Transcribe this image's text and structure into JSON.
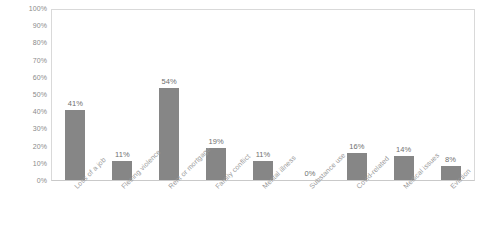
{
  "chart_data": {
    "type": "bar",
    "title": "",
    "subtitle": "",
    "xlabel": "",
    "ylabel": "",
    "ylim": [
      0,
      100
    ],
    "grid": false,
    "legend": false,
    "legend_position": "none",
    "value_suffix": "%",
    "bar_color": "#868686",
    "axis_label_color": "#9a9a9a",
    "tick_label_color": "#8a8a8a",
    "plot_border_color": "#d9d9d9",
    "categories": [
      "Loss of a job",
      "Fleeing violence",
      "Rent or mortgage",
      "Family conflict",
      "Mental illness",
      "Substance use",
      "Covid-related",
      "Medical issues",
      "Eviction"
    ],
    "values": [
      41,
      11,
      54,
      19,
      11,
      0,
      16,
      14,
      8
    ],
    "data_labels": [
      "41%",
      "11%",
      "54%",
      "19%",
      "11%",
      "0%",
      "16%",
      "14%",
      "8%"
    ],
    "y_ticks": [
      0,
      10,
      20,
      30,
      40,
      50,
      60,
      70,
      80,
      90,
      100
    ],
    "y_tick_labels": [
      "0%",
      "10%",
      "20%",
      "30%",
      "40%",
      "50%",
      "60%",
      "70%",
      "80%",
      "90%",
      "100%"
    ]
  }
}
